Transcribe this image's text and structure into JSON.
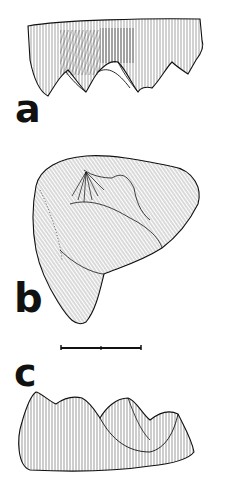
{
  "figure": {
    "panels": [
      {
        "label": "a",
        "view": "lateral view of tooth crown"
      },
      {
        "label": "b",
        "view": "occlusal view of tooth"
      },
      {
        "label": "c",
        "view": "lateral view of tooth crown (opposite side)"
      }
    ],
    "scale_bar": {
      "label": "",
      "divisions": 2
    },
    "colors": {
      "ink": "#111111",
      "background": "#ffffff"
    }
  }
}
